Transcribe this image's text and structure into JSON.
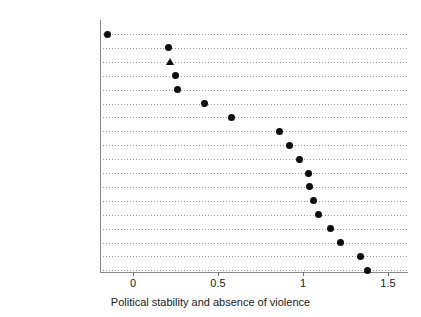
{
  "chart_data": {
    "type": "scatter",
    "title": "",
    "subtitle": "",
    "xlabel": "Political stability and absence of violence",
    "ylabel": "",
    "xlim": [
      -0.25,
      1.62
    ],
    "xticks": [
      0,
      0.5,
      1,
      1.5
    ],
    "xticklabels": [
      "0",
      "0.5",
      "1",
      "1.5"
    ],
    "grid": "horizontal-dotted",
    "legend": "none",
    "orientation": "horizontal",
    "categories": [
      "Greece",
      "France",
      "Italy",
      "United Kingdom",
      "Spain",
      "Belgium",
      "Germany",
      "Denmark",
      "Netherlands",
      "Sweden",
      "Ireland",
      "Austria",
      "Finland",
      "Portugal",
      "Norway",
      "Switzerland",
      "Luxembourg",
      "Iceland"
    ],
    "values": [
      -0.15,
      0.21,
      0.22,
      0.25,
      0.26,
      0.42,
      0.58,
      0.86,
      0.92,
      0.98,
      1.03,
      1.04,
      1.06,
      1.09,
      1.16,
      1.22,
      1.34,
      1.38
    ],
    "markers": [
      "circle",
      "circle",
      "triangle",
      "circle",
      "circle",
      "circle",
      "circle",
      "circle",
      "circle",
      "circle",
      "circle",
      "circle",
      "circle",
      "circle",
      "circle",
      "circle",
      "circle",
      "circle"
    ],
    "marker_color": "#0d0d0d",
    "points": [
      {
        "label": "Greece",
        "value": -0.15,
        "marker": "circle"
      },
      {
        "label": "France",
        "value": 0.21,
        "marker": "circle"
      },
      {
        "label": "Italy",
        "value": 0.22,
        "marker": "triangle"
      },
      {
        "label": "United Kingdom",
        "value": 0.25,
        "marker": "circle"
      },
      {
        "label": "Spain",
        "value": 0.26,
        "marker": "circle"
      },
      {
        "label": "Belgium",
        "value": 0.42,
        "marker": "circle"
      },
      {
        "label": "Germany",
        "value": 0.58,
        "marker": "circle"
      },
      {
        "label": "Denmark",
        "value": 0.86,
        "marker": "circle"
      },
      {
        "label": "Netherlands",
        "value": 0.92,
        "marker": "circle"
      },
      {
        "label": "Sweden",
        "value": 0.98,
        "marker": "circle"
      },
      {
        "label": "Ireland",
        "value": 1.03,
        "marker": "circle"
      },
      {
        "label": "Austria",
        "value": 1.04,
        "marker": "circle"
      },
      {
        "label": "Finland",
        "value": 1.06,
        "marker": "circle"
      },
      {
        "label": "Portugal",
        "value": 1.09,
        "marker": "circle"
      },
      {
        "label": "Norway",
        "value": 1.16,
        "marker": "circle"
      },
      {
        "label": "Switzerland",
        "value": 1.22,
        "marker": "circle"
      },
      {
        "label": "Luxembourg",
        "value": 1.34,
        "marker": "circle"
      },
      {
        "label": "Iceland",
        "value": 1.38,
        "marker": "circle"
      }
    ]
  }
}
